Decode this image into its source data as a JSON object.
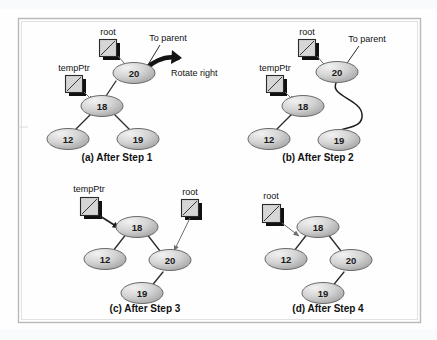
{
  "figure": {
    "background_color": "#fefefe",
    "frame_color": "#b9b9b9",
    "node_fill_light": "#eeeeee",
    "node_fill_dark": "#9d9d9d",
    "node_stroke": "#6a6a6a",
    "edge_color": "#2b2b2b",
    "pointer_box_fill": "#d6d6d6",
    "pointer_box_shadow": "#101010"
  },
  "panels": [
    {
      "id": "panel-a",
      "caption": "(a) After Step 1",
      "pointers": [
        {
          "name": "root",
          "label": "root"
        },
        {
          "name": "tempPtr",
          "label": "tempPtr"
        }
      ],
      "annotations": [
        {
          "name": "to-parent",
          "label": "To parent"
        },
        {
          "name": "rotate-right",
          "label": "Rotate right"
        }
      ],
      "nodes": [
        {
          "name": "node-20",
          "label": "20"
        },
        {
          "name": "node-18",
          "label": "18"
        },
        {
          "name": "node-12",
          "label": "12"
        },
        {
          "name": "node-19",
          "label": "19"
        }
      ],
      "edges": [
        {
          "from": "20",
          "to": "18"
        },
        {
          "from": "18",
          "to": "12"
        },
        {
          "from": "18",
          "to": "19"
        }
      ]
    },
    {
      "id": "panel-b",
      "caption": "(b) After Step 2",
      "pointers": [
        {
          "name": "root",
          "label": "root"
        },
        {
          "name": "tempPtr",
          "label": "tempPtr"
        }
      ],
      "annotations": [
        {
          "name": "to-parent",
          "label": "To parent"
        }
      ],
      "nodes": [
        {
          "name": "node-20",
          "label": "20"
        },
        {
          "name": "node-18",
          "label": "18"
        },
        {
          "name": "node-12",
          "label": "12"
        },
        {
          "name": "node-19",
          "label": "19"
        }
      ],
      "edges": [
        {
          "from": "18",
          "to": "12"
        },
        {
          "from": "20",
          "to": "19"
        }
      ]
    },
    {
      "id": "panel-c",
      "caption": "(c) After Step 3",
      "pointers": [
        {
          "name": "tempPtr",
          "label": "tempPtr"
        },
        {
          "name": "root",
          "label": "root"
        }
      ],
      "annotations": [],
      "nodes": [
        {
          "name": "node-18",
          "label": "18"
        },
        {
          "name": "node-12",
          "label": "12"
        },
        {
          "name": "node-20",
          "label": "20"
        },
        {
          "name": "node-19",
          "label": "19"
        }
      ],
      "edges": [
        {
          "from": "18",
          "to": "12"
        },
        {
          "from": "18",
          "to": "20"
        },
        {
          "from": "20",
          "to": "19"
        }
      ]
    },
    {
      "id": "panel-d",
      "caption": "(d) After Step 4",
      "pointers": [
        {
          "name": "root",
          "label": "root"
        }
      ],
      "annotations": [],
      "nodes": [
        {
          "name": "node-18",
          "label": "18"
        },
        {
          "name": "node-12",
          "label": "12"
        },
        {
          "name": "node-20",
          "label": "20"
        },
        {
          "name": "node-19",
          "label": "19"
        }
      ],
      "edges": [
        {
          "from": "18",
          "to": "12"
        },
        {
          "from": "18",
          "to": "20"
        },
        {
          "from": "20",
          "to": "19"
        }
      ]
    }
  ]
}
